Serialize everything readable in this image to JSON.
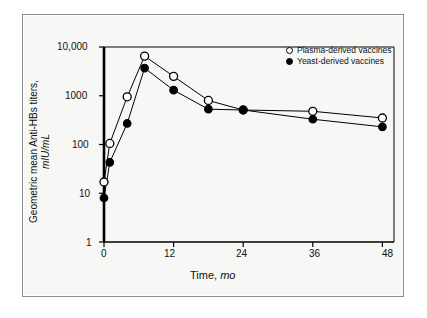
{
  "chart_data": {
    "type": "line",
    "title": "",
    "subtitle": "",
    "xlabel": "Time,",
    "xlabel_units": "mo",
    "ylabel": "Geometric mean Anti-HBs titers,",
    "ylabel_units": "mIU/mL",
    "yscale": "log",
    "ylim": [
      1,
      10000
    ],
    "xlim": [
      0,
      50
    ],
    "grid": false,
    "legend_position": "top-right",
    "x_ticks": [
      0,
      12,
      24,
      36,
      48
    ],
    "x_tick_labels": [
      "0",
      "12",
      "24",
      "36",
      "48"
    ],
    "y_ticks": [
      1,
      10,
      100,
      1000,
      10000
    ],
    "y_tick_labels": [
      "1",
      "10",
      "100",
      "1000",
      "10,000"
    ],
    "series": [
      {
        "name": "Plasma-derived vaccines",
        "marker": "open-circle",
        "color": "#000000",
        "x": [
          0,
          1,
          4,
          7,
          12,
          18,
          24,
          36,
          48
        ],
        "values": [
          17,
          105,
          950,
          6500,
          2500,
          800,
          510,
          480,
          350
        ]
      },
      {
        "name": "Yeast-derived vaccines",
        "marker": "filled-circle",
        "color": "#000000",
        "x": [
          0,
          1,
          4,
          7,
          12,
          18,
          24,
          36,
          48
        ],
        "values": [
          8,
          43,
          270,
          3700,
          1300,
          530,
          510,
          330,
          230
        ]
      }
    ]
  },
  "legend": {
    "items": [
      {
        "label": "Plasma-derived vaccines",
        "marker": "open-circle"
      },
      {
        "label": "Yeast-derived vaccines",
        "marker": "filled-circle"
      }
    ]
  },
  "axes": {
    "x_title_text": "Time,",
    "x_title_units": "mo",
    "y_title_text": "Geometric mean Anti-HBs titers,",
    "y_title_units": "mIU/mL"
  }
}
